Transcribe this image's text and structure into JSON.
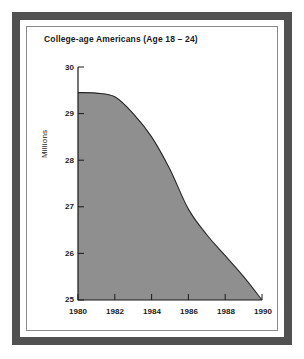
{
  "chart_data": {
    "type": "area",
    "title": "College-age Americans (Age 18 – 24)",
    "xlabel": "",
    "ylabel": "Millions",
    "xlim": [
      1980,
      1990
    ],
    "ylim": [
      25,
      30
    ],
    "grid": false,
    "legend": null,
    "fill_color": "#8f8f8f",
    "line_color": "#262626",
    "axis_color": "#1a1a1a",
    "x_tick_labels": [
      "1980",
      "1982",
      "1984",
      "1986",
      "1988",
      "1990"
    ],
    "x_ticks": [
      1980,
      1982,
      1984,
      1986,
      1988,
      1990
    ],
    "y_tick_labels": [
      "30",
      "29",
      "28",
      "27",
      "26",
      "25"
    ],
    "y_ticks": [
      30,
      29,
      28,
      27,
      26,
      25
    ],
    "x": [
      1980,
      1981,
      1982,
      1983,
      1984,
      1985,
      1986,
      1987,
      1988,
      1989,
      1990
    ],
    "values": [
      29.45,
      29.44,
      29.36,
      29.0,
      28.5,
      27.8,
      26.95,
      26.4,
      25.95,
      25.5,
      25.0
    ],
    "series": [
      {
        "name": "College-age Americans (Age 18 – 24)",
        "values": [
          29.45,
          29.44,
          29.36,
          29.0,
          28.5,
          27.8,
          26.95,
          26.4,
          25.95,
          25.5,
          25.0
        ]
      }
    ]
  },
  "frame": {
    "outer_border_color": "#515151",
    "inner_rule_color": "#8a8a8a",
    "background_color": "#ffffff"
  }
}
